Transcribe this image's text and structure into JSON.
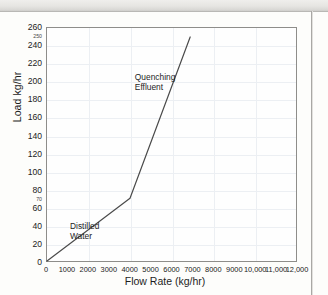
{
  "chart_data": {
    "type": "line",
    "title": "",
    "xlabel": "Flow Rate (kg/hr)",
    "ylabel": "Load kg/hr",
    "xlim": [
      0,
      12000
    ],
    "ylim": [
      0,
      260
    ],
    "grid": true,
    "legend": "none",
    "xticks": [
      "0",
      "1000",
      "2000",
      "3000",
      "4000",
      "5000",
      "6000",
      "7000",
      "8000",
      "9000",
      "10,000",
      "11,000",
      "12,000"
    ],
    "xtick_values": [
      0,
      1000,
      2000,
      3000,
      4000,
      5000,
      6000,
      7000,
      8000,
      9000,
      10000,
      11000,
      12000
    ],
    "yticks": [
      "0",
      "20",
      "40",
      "60",
      "80",
      "100",
      "120",
      "140",
      "160",
      "180",
      "200",
      "220",
      "240",
      "260"
    ],
    "ytick_values": [
      0,
      20,
      40,
      60,
      80,
      100,
      120,
      140,
      160,
      180,
      200,
      220,
      240,
      260
    ],
    "y_minor_labels": [
      {
        "label": "70",
        "value": 70
      },
      {
        "label": "250",
        "value": 250
      }
    ],
    "series": [
      {
        "name": "Load vs Flow Rate",
        "color": "#4a4a4a",
        "x": [
          0,
          4000,
          6900
        ],
        "y": [
          0,
          70,
          250
        ]
      }
    ],
    "annotations": [
      {
        "name": "distilled-water",
        "text_line1": "Distilled",
        "text_line2": "Water",
        "x": 1100,
        "y": 40
      },
      {
        "name": "quenching-effluent",
        "text_line1": "Quenching",
        "text_line2": "Effluent",
        "x": 4200,
        "y": 205
      }
    ]
  }
}
